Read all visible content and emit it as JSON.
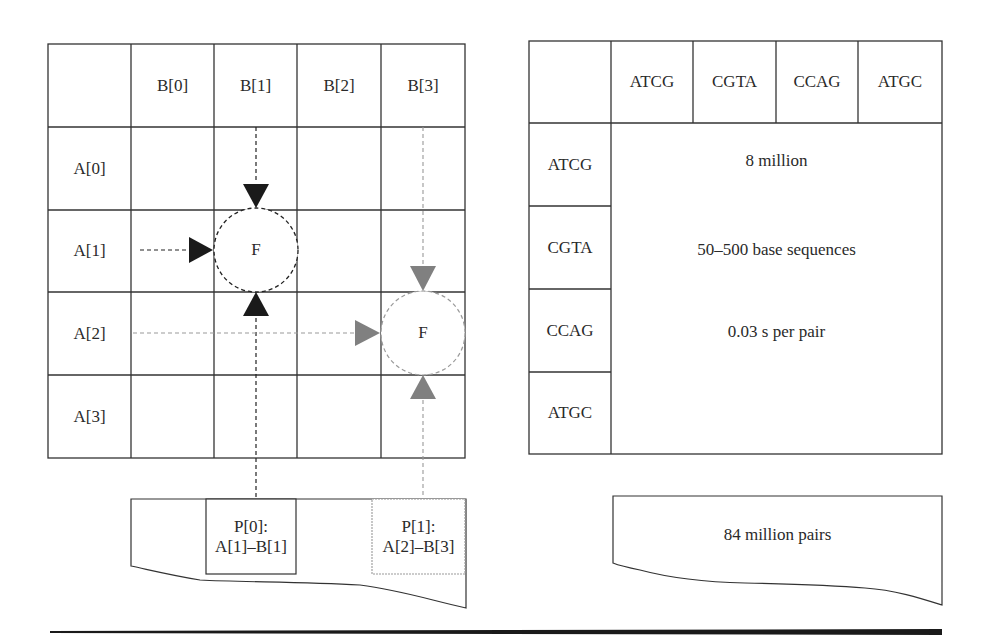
{
  "left_diagram": {
    "column_headers": [
      "B[0]",
      "B[1]",
      "B[2]",
      "B[3]"
    ],
    "row_headers": [
      "A[0]",
      "A[1]",
      "A[2]",
      "A[3]"
    ],
    "function_nodes": [
      {
        "label": "F",
        "row": "A[1]",
        "col": "B[1]",
        "color": "#1a1a1a"
      },
      {
        "label": "F",
        "row": "A[2]",
        "col": "B[3]",
        "color": "#808080"
      }
    ],
    "output": {
      "pairs": [
        {
          "title": "P[0]:",
          "pair": "A[1]–B[1]"
        },
        {
          "title": "P[1]:",
          "pair": "A[2]–B[3]"
        }
      ]
    }
  },
  "right_diagram": {
    "column_headers": [
      "ATCG",
      "CGTA",
      "CCAG",
      "ATGC"
    ],
    "row_headers": [
      "ATCG",
      "CGTA",
      "CCAG",
      "ATGC"
    ],
    "body_lines": [
      "8 million",
      "50–500 base sequences",
      "0.03 s per pair"
    ],
    "output": {
      "label": "84 million pairs"
    }
  },
  "colors": {
    "line": "#333333",
    "active": "#1a1a1a",
    "secondary": "#808080"
  }
}
